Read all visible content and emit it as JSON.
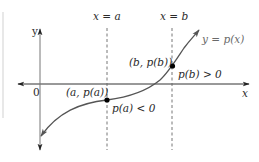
{
  "diagram": {
    "axes": {
      "x_label": "x",
      "y_label": "y",
      "origin_label": "0"
    },
    "vertical_lines": [
      {
        "label": "x = a",
        "style": "dashed"
      },
      {
        "label": "x = b",
        "style": "dashed"
      }
    ],
    "curve": {
      "label": "y = p(x)",
      "color": "#555555"
    },
    "points": [
      {
        "label": "(a, p(a))",
        "annotation": "p(a) < 0"
      },
      {
        "label": "(b, p(b))",
        "annotation": "p(b) > 0"
      }
    ],
    "colors": {
      "axis": "#333333",
      "curve": "#555555",
      "dashed": "#666666",
      "point": "#000000"
    }
  }
}
